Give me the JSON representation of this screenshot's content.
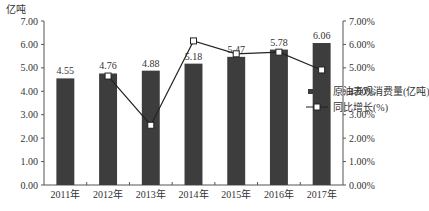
{
  "chart_data": {
    "type": "bar",
    "title": "",
    "left_axis_unit": "亿吨",
    "categories": [
      "2011年",
      "2012年",
      "2013年",
      "2014年",
      "2015年",
      "2016年",
      "2017年"
    ],
    "series": [
      {
        "name": "原油表观消费量(亿吨)",
        "type": "bar",
        "axis": "left",
        "color": "#3d3d3d",
        "values": [
          4.55,
          4.76,
          4.88,
          5.18,
          5.47,
          5.78,
          6.06
        ],
        "labels": [
          "4.55",
          "4.76",
          "4.88",
          "5.18",
          "5.47",
          "5.78",
          "6.06"
        ]
      },
      {
        "name": "同比增长(%)",
        "type": "line",
        "axis": "right",
        "color": "#222222",
        "marker": "hollow-square",
        "values": [
          null,
          4.65,
          2.55,
          6.15,
          5.6,
          5.67,
          4.91
        ]
      }
    ],
    "ylim_left": [
      0,
      7
    ],
    "ylim_right": [
      0,
      7
    ],
    "left_ticks": [
      "0.00",
      "1.00",
      "2.00",
      "3.00",
      "4.00",
      "5.00",
      "6.00",
      "7.00"
    ],
    "right_ticks": [
      "0.00%",
      "1.00%",
      "2.00%",
      "3.00%",
      "4.00%",
      "5.00%",
      "6.00%",
      "7.00%"
    ],
    "grid": false,
    "legend_position": "right"
  }
}
